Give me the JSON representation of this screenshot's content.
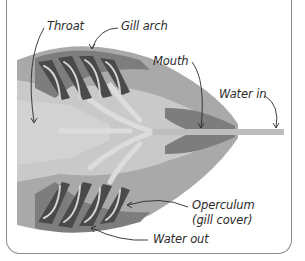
{
  "diagram": {
    "labels": {
      "throat": "Throat",
      "gill_arch": "Gill arch",
      "mouth": "Mouth",
      "water_in": "Water in",
      "operculum_line1": "Operculum",
      "operculum_line2": "(gill cover)",
      "water_out": "Water out"
    },
    "colors": {
      "frame": "#8a8a8a",
      "body_light": "#c9c9c9",
      "body_mid": "#a9a9a9",
      "body_dark": "#7d7d7d",
      "gill_dark": "#4a4a4a",
      "flow_arrows": "#dcdcdc",
      "label_text": "#2b2b2b"
    }
  }
}
